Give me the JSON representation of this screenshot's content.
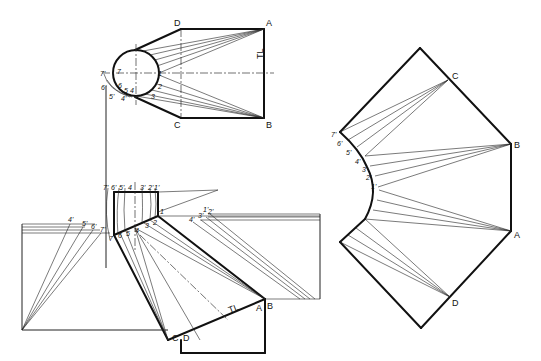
{
  "plan_view": {
    "corners": [
      "A",
      "B",
      "C",
      "D"
    ],
    "circle_points": [
      "1",
      "2",
      "3",
      "4",
      "5",
      "6",
      "7"
    ],
    "true_length_points": [
      "1'",
      "4'",
      "5'",
      "6'",
      "7'"
    ],
    "true_length_label": "TL"
  },
  "elevation_view": {
    "top_points": [
      "7'",
      "6'",
      "5'",
      "4",
      "3'",
      "2'",
      "1'"
    ],
    "bottom_points": [
      "7",
      "6",
      "5",
      "4",
      "3",
      "2",
      "1"
    ],
    "left_tl_points": [
      "4'",
      "5'",
      "6'",
      "7'"
    ],
    "right_tl_points": [
      "4'",
      "3'",
      "1'",
      "2'"
    ],
    "corners": [
      "C",
      "D",
      "A",
      "B"
    ],
    "true_length_label": "TL"
  },
  "development": {
    "corners": [
      "C",
      "B",
      "A",
      "D"
    ],
    "curve_points": [
      "7'",
      "6'",
      "5'",
      "4'",
      "3'",
      "2'",
      "1'"
    ]
  },
  "colors": {
    "line": "#111111",
    "background": "#ffffff"
  }
}
